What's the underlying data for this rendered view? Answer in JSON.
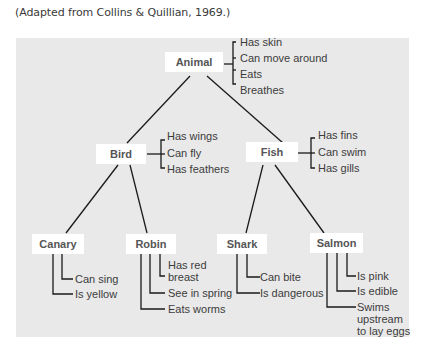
{
  "caption": "(Adapted from Collins & Quillian, 1969.)",
  "colors": {
    "panel": "#e9e9e9",
    "node_bg": "#ffffff",
    "node_text": "#555555",
    "line": "#1a1a1a",
    "prop_text": "#3c3c3c"
  },
  "nodes": {
    "animal": {
      "label": "Animal",
      "properties": [
        "Has skin",
        "Can move around",
        "Eats",
        "Breathes"
      ]
    },
    "bird": {
      "label": "Bird",
      "properties": [
        "Has wings",
        "Can fly",
        "Has feathers"
      ]
    },
    "fish": {
      "label": "Fish",
      "properties": [
        "Has fins",
        "Can swim",
        "Has gills"
      ]
    },
    "canary": {
      "label": "Canary",
      "properties": [
        "Can sing",
        "Is yellow"
      ]
    },
    "robin": {
      "label": "Robin",
      "properties": [
        "Has red",
        "breast",
        "See in spring",
        "Eats worms"
      ]
    },
    "shark": {
      "label": "Shark",
      "properties": [
        "Can bite",
        "Is dangerous"
      ]
    },
    "salmon": {
      "label": "Salmon",
      "properties": [
        "Is pink",
        "Is edible",
        "Swims",
        "upstream",
        "to lay eggs"
      ]
    }
  },
  "edges": [
    [
      "Animal",
      "Bird"
    ],
    [
      "Animal",
      "Fish"
    ],
    [
      "Bird",
      "Canary"
    ],
    [
      "Bird",
      "Robin"
    ],
    [
      "Fish",
      "Shark"
    ],
    [
      "Fish",
      "Salmon"
    ]
  ]
}
